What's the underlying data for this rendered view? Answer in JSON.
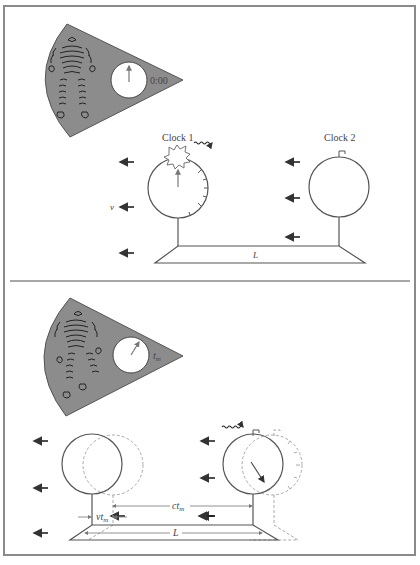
{
  "panels": [
    {
      "id": "top",
      "observer_clock_reading": "0:00",
      "clock1_label": "Clock 1",
      "clock2_label": "Clock 2",
      "velocity_label": "v",
      "length_label": "L"
    },
    {
      "id": "bottom",
      "observer_clock_reading": "t",
      "observer_clock_reading_sub": "m",
      "vt_label": "vt",
      "vt_sub": "m",
      "ct_label": "ct",
      "ct_sub": "m",
      "length_label": "L"
    }
  ],
  "colors": {
    "frame": "#8a8a8a",
    "fan_fill": "#8c8c8c",
    "line": "#555555",
    "dashed": "#aaaaaa",
    "text": "#444444"
  }
}
